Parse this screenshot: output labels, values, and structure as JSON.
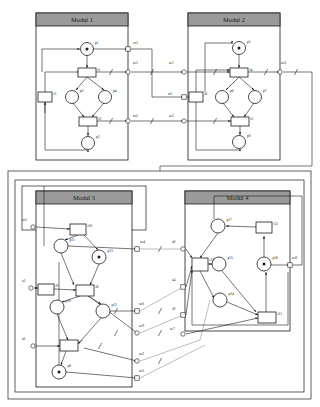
{
  "figure": {
    "type": "petri-net-module-diagram",
    "width": 320,
    "height": 407,
    "background": "#ffffff",
    "line_color": "#1a1a1a",
    "header_fill": "#9a9a9a",
    "module_fill": "#ffffff",
    "node_fill": "#ffffff",
    "token_color": "#1a1a1a"
  },
  "modules": [
    {
      "id": "m1",
      "title": "Modul 1",
      "x": 36,
      "y": 13,
      "w": 92,
      "h": 147
    },
    {
      "id": "m2",
      "title": "Modul 2",
      "x": 188,
      "y": 13,
      "w": 92,
      "h": 147
    },
    {
      "id": "m3",
      "title": "Modul 3",
      "x": 36,
      "y": 191,
      "w": 96,
      "h": 196
    },
    {
      "id": "m4",
      "title": "Modul 4",
      "x": 185,
      "y": 191,
      "w": 105,
      "h": 140
    }
  ],
  "outer_frames": [
    {
      "id": "frame-outer",
      "x": 8,
      "y": 171,
      "w": 303,
      "h": 228
    },
    {
      "id": "frame-inner",
      "x": 15,
      "y": 180,
      "w": 289,
      "h": 212
    },
    {
      "id": "frame-m3",
      "x": 22,
      "y": 186,
      "w": 124,
      "h": 44
    }
  ],
  "places": [
    {
      "id": "p1",
      "label": "p1",
      "cx": 87,
      "cy": 49,
      "r": 6.5,
      "token": true
    },
    {
      "id": "p2",
      "label": "p2",
      "cx": 72,
      "cy": 97,
      "r": 6.5,
      "token": false
    },
    {
      "id": "p4",
      "label": "p4",
      "cx": 105,
      "cy": 97,
      "r": 6.5,
      "token": false
    },
    {
      "id": "p3",
      "label": "p3",
      "cx": 88,
      "cy": 143,
      "r": 6.5,
      "token": false
    },
    {
      "id": "p5",
      "label": "p5",
      "cx": 239,
      "cy": 48,
      "r": 6.5,
      "token": true
    },
    {
      "id": "p6",
      "label": "p6",
      "cx": 222,
      "cy": 97,
      "r": 6.5,
      "token": false
    },
    {
      "id": "p7",
      "label": "p7",
      "cx": 255,
      "cy": 97,
      "r": 6.5,
      "token": false
    },
    {
      "id": "p8",
      "label": "p8",
      "cx": 239,
      "cy": 142,
      "r": 6.5,
      "token": false
    },
    {
      "id": "p11",
      "label": "p11",
      "cx": 61,
      "cy": 246,
      "r": 7.0,
      "token": false
    },
    {
      "id": "p13",
      "label": "p13",
      "cx": 99,
      "cy": 257,
      "r": 7.0,
      "token": true
    },
    {
      "id": "p10",
      "label": "p10",
      "cx": 57,
      "cy": 307,
      "r": 7.0,
      "token": false
    },
    {
      "id": "p12",
      "label": "p12",
      "cx": 103,
      "cy": 311,
      "r": 7.0,
      "token": false
    },
    {
      "id": "p8b",
      "label": "p8",
      "cx": 59,
      "cy": 372,
      "r": 7.0,
      "token": true
    },
    {
      "id": "p17",
      "label": "p17",
      "cx": 218,
      "cy": 226,
      "r": 7.0,
      "token": false
    },
    {
      "id": "p15",
      "label": "p15",
      "cx": 219,
      "cy": 264,
      "r": 7.0,
      "token": false
    },
    {
      "id": "p16",
      "label": "p16",
      "cx": 264,
      "cy": 264,
      "r": 7.0,
      "token": true
    },
    {
      "id": "p14",
      "label": "p14",
      "cx": 220,
      "cy": 300,
      "r": 7.0,
      "token": false
    }
  ],
  "transitions": [
    {
      "id": "t1",
      "label": "t1",
      "x": 78,
      "y": 68,
      "w": 18,
      "h": 9
    },
    {
      "id": "t3",
      "label": "t3",
      "x": 38,
      "y": 92,
      "w": 14,
      "h": 10
    },
    {
      "id": "t2",
      "label": "t2",
      "x": 79,
      "y": 117,
      "w": 18,
      "h": 9
    },
    {
      "id": "t4",
      "label": "t4",
      "x": 230,
      "y": 68,
      "w": 18,
      "h": 9
    },
    {
      "id": "t6",
      "label": "t6",
      "x": 189,
      "y": 92,
      "w": 14,
      "h": 10
    },
    {
      "id": "t5",
      "label": "t5",
      "x": 231,
      "y": 117,
      "w": 18,
      "h": 9
    },
    {
      "id": "t10",
      "label": "t10",
      "x": 70,
      "y": 224,
      "w": 16,
      "h": 11
    },
    {
      "id": "t9",
      "label": "t9",
      "x": 38,
      "y": 284,
      "w": 16,
      "h": 11
    },
    {
      "id": "t8",
      "label": "t8",
      "x": 76,
      "y": 285,
      "w": 18,
      "h": 11
    },
    {
      "id": "t7",
      "label": "t7",
      "x": 60,
      "y": 340,
      "w": 18,
      "h": 11
    },
    {
      "id": "t12",
      "label": "t12",
      "x": 256,
      "y": 222,
      "w": 16,
      "h": 11
    },
    {
      "id": "t13",
      "label": "t13",
      "x": 192,
      "y": 258,
      "w": 16,
      "h": 13
    },
    {
      "id": "t11",
      "label": "t11",
      "x": 258,
      "y": 312,
      "w": 18,
      "h": 11
    }
  ],
  "connection_labels": [
    {
      "id": "en1",
      "text": "en1",
      "x": 133,
      "y": 44
    },
    {
      "id": "ao1",
      "text": "ao1",
      "x": 133,
      "y": 64
    },
    {
      "id": "ae1",
      "text": "ae1",
      "x": 169,
      "y": 64
    },
    {
      "id": "ao3",
      "text": "ao3",
      "x": 281,
      "y": 64
    },
    {
      "id": "af1",
      "text": "af1",
      "x": 168,
      "y": 95
    },
    {
      "id": "ao2",
      "text": "ao2",
      "x": 133,
      "y": 117
    },
    {
      "id": "ae2",
      "text": "ae2",
      "x": 169,
      "y": 117
    },
    {
      "id": "ao5",
      "text": "ao5",
      "x": 22,
      "y": 221
    },
    {
      "id": "ao4",
      "text": "ao4",
      "x": 140,
      "y": 243
    },
    {
      "id": "a8",
      "text": "a8",
      "x": 172,
      "y": 243
    },
    {
      "id": "ao8",
      "text": "ao8",
      "x": 292,
      "y": 259
    },
    {
      "id": "a3",
      "text": "a3",
      "x": 22,
      "y": 282
    },
    {
      "id": "a4",
      "text": "a4",
      "x": 172,
      "y": 281
    },
    {
      "id": "ao6",
      "text": "ao6",
      "x": 139,
      "y": 305
    },
    {
      "id": "a9",
      "text": "a9",
      "x": 172,
      "y": 310
    },
    {
      "id": "ao9",
      "text": "ao9",
      "x": 139,
      "y": 327
    },
    {
      "id": "ae7",
      "text": "ae7",
      "x": 170,
      "y": 330
    },
    {
      "id": "a6",
      "text": "a6",
      "x": 22,
      "y": 340
    },
    {
      "id": "ao2b",
      "text": "ao2",
      "x": 139,
      "y": 355
    },
    {
      "id": "ao3b",
      "text": "ao3",
      "x": 139,
      "y": 372
    }
  ],
  "ports": [
    {
      "id": "port-en1",
      "shape": "square",
      "x": 128,
      "y": 49
    },
    {
      "id": "port-ao1",
      "shape": "circle",
      "x": 128,
      "y": 72
    },
    {
      "id": "port-ae1",
      "shape": "circle",
      "x": 184,
      "y": 72
    },
    {
      "id": "port-ao3",
      "shape": "circle",
      "x": 280,
      "y": 72
    },
    {
      "id": "port-af1",
      "shape": "square",
      "x": 184,
      "y": 97
    },
    {
      "id": "port-ao2",
      "shape": "circle",
      "x": 128,
      "y": 121
    },
    {
      "id": "port-ae2",
      "shape": "circle",
      "x": 184,
      "y": 121
    },
    {
      "id": "port-ao5",
      "shape": "circle",
      "x": 33,
      "y": 227
    },
    {
      "id": "port-ao4",
      "shape": "square",
      "x": 137,
      "y": 249
    },
    {
      "id": "port-a8",
      "shape": "circle",
      "x": 183,
      "y": 249
    },
    {
      "id": "port-ao8",
      "shape": "square",
      "x": 290,
      "y": 265
    },
    {
      "id": "port-a3",
      "shape": "circle",
      "x": 31,
      "y": 288
    },
    {
      "id": "port-a4",
      "shape": "square",
      "x": 183,
      "y": 287
    },
    {
      "id": "port-ao6",
      "shape": "square",
      "x": 137,
      "y": 311
    },
    {
      "id": "port-a9",
      "shape": "square",
      "x": 183,
      "y": 315
    },
    {
      "id": "port-ao9",
      "shape": "circle",
      "x": 137,
      "y": 333
    },
    {
      "id": "port-ae7",
      "shape": "circle",
      "x": 183,
      "y": 334
    },
    {
      "id": "port-a6",
      "shape": "circle",
      "x": 33,
      "y": 346
    },
    {
      "id": "port-ao2b",
      "shape": "circle",
      "x": 137,
      "y": 361
    },
    {
      "id": "port-ao3b",
      "shape": "square",
      "x": 137,
      "y": 378
    }
  ]
}
